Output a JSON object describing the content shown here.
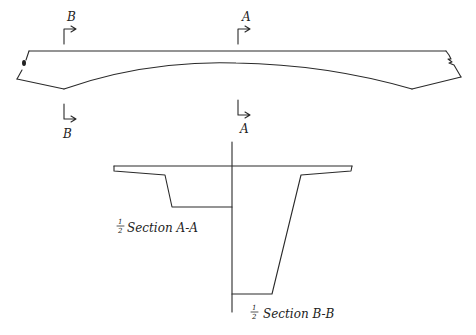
{
  "diagram": {
    "type": "engineering-sketch",
    "elevation": {
      "section_marks": [
        {
          "id": "B",
          "top_label": "B",
          "bottom_label": "B"
        },
        {
          "id": "A",
          "top_label": "A",
          "bottom_label": "A"
        }
      ],
      "left_end_mark": "≈",
      "right_end_mark": "≈"
    },
    "sections": {
      "a_a": {
        "fraction": "½",
        "label": "Section A-A"
      },
      "b_b": {
        "fraction": "½",
        "label": "Section B-B"
      }
    },
    "colors": {
      "ink": "#2a2a2a",
      "background": "#ffffff"
    }
  }
}
